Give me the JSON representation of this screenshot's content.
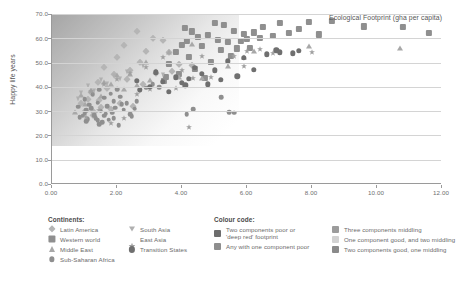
{
  "chart_data": {
    "type": "scatter",
    "title": "",
    "xlabel": "Ecological Footprint (gha per capita)",
    "ylabel": "Happy life years",
    "xlim": [
      0,
      12
    ],
    "ylim": [
      0,
      70
    ],
    "xticks": [
      "0.00",
      "2.00",
      "4.00",
      "6.00",
      "8.00",
      "10.00",
      "12.00"
    ],
    "yticks": [
      "0.0",
      "10.0",
      "20.0",
      "30.0",
      "40.0",
      "50.0",
      "60.0",
      "70.0"
    ],
    "grid": "horizontal",
    "legend_position": "below",
    "series": [
      {
        "name": "Latin America",
        "marker": "diamond",
        "points": [
          [
            2.6,
            62.9
          ],
          [
            3.1,
            60.2
          ],
          [
            3.4,
            59.4
          ],
          [
            2.2,
            57.1
          ],
          [
            2.9,
            54.8
          ],
          [
            3.6,
            54.2
          ],
          [
            2.0,
            52.3
          ],
          [
            2.7,
            50.1
          ],
          [
            3.9,
            49.6
          ],
          [
            1.6,
            48.2
          ],
          [
            2.4,
            47.0
          ],
          [
            3.2,
            45.9
          ],
          [
            1.9,
            45.1
          ],
          [
            2.3,
            43.4
          ],
          [
            1.4,
            42.0
          ],
          [
            2.8,
            41.2
          ],
          [
            1.7,
            39.6
          ],
          [
            1.2,
            37.8
          ],
          [
            4.3,
            49.2
          ],
          [
            3.7,
            46.4
          ],
          [
            1.1,
            35.2
          ],
          [
            2.1,
            33.4
          ],
          [
            1.5,
            31.6
          ],
          [
            1.3,
            29.8
          ],
          [
            1.8,
            30.8
          ],
          [
            2.5,
            32.2
          ],
          [
            1.0,
            30.1
          ],
          [
            0.9,
            33.2
          ],
          [
            1.25,
            28.6
          ],
          [
            1.45,
            34.6
          ]
        ]
      },
      {
        "name": "Western world",
        "marker": "square",
        "points": [
          [
            11.6,
            62.1
          ],
          [
            10.8,
            64.6
          ],
          [
            9.6,
            64.9
          ],
          [
            8.6,
            67.0
          ],
          [
            7.9,
            66.8
          ],
          [
            7.0,
            66.4
          ],
          [
            6.5,
            64.7
          ],
          [
            6.2,
            62.4
          ],
          [
            5.9,
            61.8
          ],
          [
            5.6,
            63.2
          ],
          [
            5.3,
            65.6
          ],
          [
            5.0,
            66.2
          ],
          [
            4.8,
            61.4
          ],
          [
            4.5,
            60.6
          ],
          [
            4.3,
            62.8
          ],
          [
            4.1,
            64.2
          ],
          [
            5.1,
            59.4
          ],
          [
            5.4,
            58.4
          ],
          [
            5.8,
            58.8
          ],
          [
            6.0,
            59.6
          ],
          [
            6.4,
            60.2
          ],
          [
            6.8,
            61.0
          ],
          [
            7.3,
            62.2
          ],
          [
            4.6,
            56.8
          ],
          [
            4.0,
            57.2
          ],
          [
            3.8,
            54.4
          ],
          [
            4.2,
            52.2
          ],
          [
            4.9,
            50.4
          ],
          [
            5.2,
            55.2
          ],
          [
            3.6,
            49.6
          ],
          [
            4.4,
            47.4
          ],
          [
            3.9,
            45.2
          ],
          [
            5.5,
            52.8
          ],
          [
            6.1,
            56.2
          ],
          [
            7.6,
            63.8
          ],
          [
            8.2,
            61.6
          ],
          [
            3.5,
            44.2
          ],
          [
            4.7,
            43.8
          ],
          [
            5.7,
            55.8
          ],
          [
            4.15,
            59.0
          ],
          [
            3.45,
            42.6
          ]
        ]
      },
      {
        "name": "Middle East",
        "marker": "triangle",
        "points": [
          [
            10.7,
            56.0
          ],
          [
            5.9,
            52.4
          ],
          [
            4.3,
            57.8
          ],
          [
            3.6,
            54.2
          ],
          [
            2.9,
            50.2
          ],
          [
            3.2,
            46.6
          ],
          [
            2.4,
            45.4
          ],
          [
            2.0,
            44.8
          ],
          [
            3.9,
            44.2
          ],
          [
            1.6,
            42.2
          ],
          [
            2.6,
            40.6
          ],
          [
            1.2,
            38.8
          ],
          [
            1.0,
            33.0
          ],
          [
            0.7,
            29.6
          ],
          [
            1.5,
            36.4
          ],
          [
            4.6,
            43.8
          ],
          [
            5.4,
            48.4
          ],
          [
            3.0,
            43.0
          ],
          [
            1.8,
            41.2
          ],
          [
            0.9,
            36.6
          ],
          [
            2.2,
            39.2
          ],
          [
            7.9,
            57.0
          ],
          [
            6.2,
            54.6
          ]
        ]
      },
      {
        "name": "Sub-Saharan Africa",
        "marker": "circle",
        "points": [
          [
            1.0,
            29.0
          ],
          [
            1.2,
            31.2
          ],
          [
            1.4,
            33.4
          ],
          [
            1.6,
            35.6
          ],
          [
            1.8,
            37.2
          ],
          [
            2.0,
            39.0
          ],
          [
            1.1,
            26.8
          ],
          [
            1.3,
            28.4
          ],
          [
            1.5,
            30.2
          ],
          [
            1.7,
            32.0
          ],
          [
            1.9,
            34.2
          ],
          [
            2.1,
            36.0
          ],
          [
            0.8,
            31.8
          ],
          [
            1.0,
            34.8
          ],
          [
            1.25,
            37.0
          ],
          [
            1.45,
            38.8
          ],
          [
            2.2,
            30.6
          ],
          [
            2.4,
            28.8
          ],
          [
            1.05,
            25.8
          ],
          [
            1.35,
            27.2
          ],
          [
            1.55,
            25.4
          ],
          [
            1.75,
            26.4
          ],
          [
            2.3,
            33.2
          ],
          [
            2.6,
            34.0
          ],
          [
            1.15,
            32.6
          ],
          [
            0.95,
            28.2
          ],
          [
            2.05,
            24.2
          ],
          [
            2.45,
            27.8
          ],
          [
            1.85,
            29.4
          ],
          [
            1.65,
            29.0
          ],
          [
            2.7,
            38.6
          ],
          [
            2.9,
            39.6
          ],
          [
            3.1,
            41.0
          ],
          [
            1.95,
            31.4
          ],
          [
            2.15,
            32.8
          ],
          [
            2.55,
            31.0
          ],
          [
            1.05,
            30.4
          ],
          [
            0.85,
            27.6
          ],
          [
            1.45,
            24.6
          ],
          [
            3.3,
            39.8
          ],
          [
            4.35,
            30.8
          ],
          [
            4.15,
            28.8
          ],
          [
            5.45,
            29.6
          ],
          [
            5.6,
            29.4
          ],
          [
            5.2,
            35.8
          ],
          [
            1.6,
            28.2
          ],
          [
            1.4,
            26.2
          ],
          [
            1.9,
            27.0
          ]
        ]
      },
      {
        "name": "South Asia",
        "marker": "inverted-triangle",
        "points": [
          [
            2.8,
            48.6
          ],
          [
            2.3,
            46.2
          ],
          [
            1.9,
            44.6
          ],
          [
            1.5,
            42.8
          ],
          [
            1.1,
            40.4
          ],
          [
            0.9,
            37.6
          ],
          [
            3.4,
            45.0
          ],
          [
            1.3,
            38.4
          ],
          [
            2.1,
            43.4
          ],
          [
            0.8,
            34.8
          ],
          [
            1.7,
            41.0
          ]
        ]
      },
      {
        "name": "East Asia",
        "marker": "star",
        "points": [
          [
            8.0,
            57.4
          ],
          [
            6.8,
            57.0
          ],
          [
            6.0,
            57.8
          ],
          [
            5.6,
            56.0
          ],
          [
            4.6,
            55.8
          ],
          [
            4.0,
            50.2
          ],
          [
            3.4,
            55.6
          ],
          [
            2.9,
            51.2
          ],
          [
            2.4,
            49.0
          ],
          [
            2.0,
            46.4
          ],
          [
            1.6,
            44.2
          ],
          [
            1.2,
            41.4
          ],
          [
            4.9,
            47.2
          ],
          [
            3.0,
            42.4
          ],
          [
            2.6,
            40.4
          ],
          [
            3.8,
            42.8
          ],
          [
            1.45,
            33.6
          ],
          [
            4.2,
            26.8
          ],
          [
            5.9,
            51.6
          ],
          [
            2.2,
            30.2
          ],
          [
            1.05,
            30.8
          ],
          [
            1.8,
            28.4
          ],
          [
            6.4,
            58.6
          ],
          [
            4.35,
            46.8
          ]
        ]
      },
      {
        "name": "Transition States",
        "marker": "circle-dark",
        "points": [
          [
            5.9,
            52.0
          ],
          [
            5.4,
            50.6
          ],
          [
            5.0,
            46.8
          ],
          [
            4.6,
            45.4
          ],
          [
            4.2,
            43.2
          ],
          [
            3.8,
            44.0
          ],
          [
            3.4,
            42.0
          ],
          [
            3.0,
            40.0
          ],
          [
            2.7,
            38.8
          ],
          [
            3.2,
            46.0
          ],
          [
            4.4,
            47.8
          ],
          [
            4.0,
            41.6
          ],
          [
            6.2,
            47.0
          ],
          [
            6.6,
            53.4
          ],
          [
            7.0,
            54.2
          ],
          [
            7.4,
            53.8
          ],
          [
            5.2,
            42.8
          ],
          [
            4.8,
            41.0
          ],
          [
            3.6,
            38.0
          ],
          [
            6.9,
            55.0
          ],
          [
            7.6,
            54.8
          ],
          [
            5.7,
            44.4
          ],
          [
            2.6,
            42.6
          ],
          [
            4.1,
            40.6
          ]
        ]
      }
    ]
  },
  "legend": {
    "continents_heading": "Continents:",
    "colour_heading": "Colour code:",
    "continents_col1": [
      {
        "label": "Latin America",
        "marker": "diamond"
      },
      {
        "label": "Western world",
        "marker": "square"
      },
      {
        "label": "Middle East",
        "marker": "triangle"
      },
      {
        "label": "Sub-Saharan Africa",
        "marker": "circle"
      }
    ],
    "continents_col2": [
      {
        "label": "South Asia",
        "marker": "inverted-triangle"
      },
      {
        "label": "East Asia",
        "marker": "star"
      },
      {
        "label": "Transition States",
        "marker": "circle-dark"
      }
    ],
    "colour_col1": [
      {
        "label": "Two components poor or\n'deep red' footprint",
        "color": "#6d6d6d"
      },
      {
        "label": "Any with one component poor",
        "color": "#8e8e8e"
      }
    ],
    "colour_col2": [
      {
        "label": "Three components middling",
        "color": "#9c9c9c"
      },
      {
        "label": "One component good, and two middling",
        "color": "#d2d2d2"
      },
      {
        "label": "Two components good, one middling",
        "color": "#8a8a8a"
      }
    ]
  },
  "colors": {
    "grid": "#d4d4d4",
    "axis": "#9a9a9a",
    "tick_text": "#6e6e6e",
    "axis_title": "#555555",
    "marker_light": "#b9b9b9",
    "marker_mid": "#9c9c9c",
    "marker_dark": "#6d6d6d"
  }
}
